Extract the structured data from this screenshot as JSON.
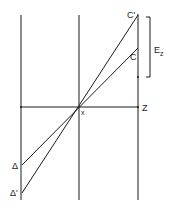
{
  "diagram": {
    "labels": {
      "c_prime": "C'",
      "c": "C",
      "e_z": "E",
      "e_z_sub": "z",
      "z": "Z",
      "x": "x",
      "delta": "Δ",
      "delta_prime": "Δ'"
    },
    "colors": {
      "line": "#1a1a1a",
      "background": "#ffffff"
    }
  }
}
